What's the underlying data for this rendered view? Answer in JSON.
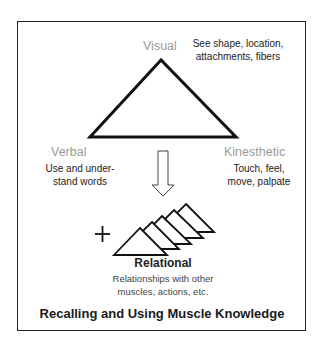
{
  "diagram": {
    "title": "Recalling and Using Muscle Knowledge",
    "nodes": {
      "visual": {
        "label": "Visual",
        "desc_line1": "See shape, location,",
        "desc_line2": "attachments, fibers"
      },
      "verbal": {
        "label": "Verbal",
        "desc_line1": "Use and under-",
        "desc_line2": "stand words"
      },
      "kinesthetic": {
        "label": "Kinesthetic",
        "desc_line1": "Touch, feel,",
        "desc_line2": "move, palpate"
      },
      "relational": {
        "label": "Relational",
        "desc_line1": "Relationships with other",
        "desc_line2": "muscles, actions, etc."
      }
    },
    "plus_symbol": "+",
    "colors": {
      "label_gray": "#9a9a9a",
      "stroke": "#111111"
    }
  }
}
